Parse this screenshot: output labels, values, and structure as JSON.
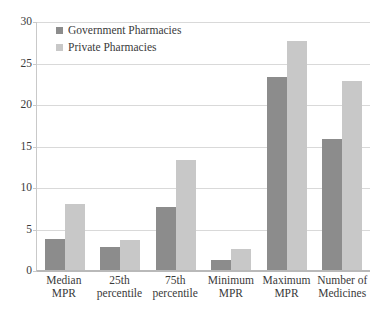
{
  "chart_data": {
    "type": "bar",
    "title": "",
    "xlabel": "",
    "ylabel": "",
    "ylim": [
      0,
      30
    ],
    "ytick_step": 5,
    "yticks": [
      30,
      25,
      20,
      15,
      10,
      5,
      0
    ],
    "grid": true,
    "legend_position": "top-left-inside",
    "categories": [
      "Median\nMPR",
      "25th\npercentile",
      "75th\npercentile",
      "Minimum\nMPR",
      "Maximum\nMPR",
      "Number of\nMedicines"
    ],
    "category_lines": [
      [
        "Median",
        "MPR"
      ],
      [
        "25th",
        "percentile"
      ],
      [
        "75th",
        "percentile"
      ],
      [
        "Minimum",
        "MPR"
      ],
      [
        "Maximum",
        "MPR"
      ],
      [
        "Number of",
        "Medicines"
      ]
    ],
    "series": [
      {
        "name": "Government Pharmacies",
        "color": "#8c8c8c",
        "values": [
          3.7,
          2.8,
          7.6,
          1.2,
          23.4,
          15.9
        ]
      },
      {
        "name": "Private Pharmacies",
        "color": "#c8c8c8",
        "values": [
          8.0,
          3.6,
          13.3,
          2.5,
          27.7,
          22.9
        ]
      }
    ]
  },
  "legend": {
    "items": [
      {
        "label": "Government Pharmacies",
        "color": "#8c8c8c"
      },
      {
        "label": "Private Pharmacies",
        "color": "#c8c8c8"
      }
    ]
  },
  "caption": {
    "text": ""
  }
}
